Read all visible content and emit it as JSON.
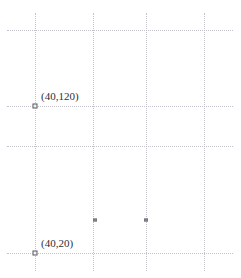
{
  "chart_data": {
    "type": "scatter",
    "title": "",
    "xlabel": "",
    "ylabel": "",
    "grid": true,
    "legend": null,
    "xlim": [
      0,
      260
    ],
    "ylim": [
      0,
      160
    ],
    "xticks": [
      40,
      100,
      160,
      220
    ],
    "yticks": [
      20,
      80,
      100,
      150
    ],
    "points": [
      {
        "label": "(40,120)",
        "x": 40,
        "y": 120,
        "has_label": true,
        "px": 35,
        "py": 106,
        "marker": "square"
      },
      {
        "label": "(40,20)",
        "x": 40,
        "y": 20,
        "has_label": true,
        "px": 35,
        "py": 253,
        "marker": "square"
      },
      {
        "label": "",
        "x": 100,
        "y": 35,
        "has_label": false,
        "px": 95,
        "py": 220,
        "marker": "square-small"
      },
      {
        "label": "",
        "x": 160,
        "y": 35,
        "has_label": false,
        "px": 146,
        "py": 220,
        "marker": "square-small"
      }
    ],
    "gridlines_vertical": [
      {
        "name": "gridline-x-40",
        "px": 35,
        "top": 13,
        "bottom": 271
      },
      {
        "name": "gridline-x-100",
        "px": 93,
        "top": 13,
        "bottom": 271
      },
      {
        "name": "gridline-x-160",
        "px": 146,
        "top": 13,
        "bottom": 271
      },
      {
        "name": "gridline-x-220",
        "px": 204,
        "top": 13,
        "bottom": 271
      }
    ],
    "gridlines_horizontal": [
      {
        "name": "gridline-y-150",
        "py": 30,
        "left": 7,
        "right": 233
      },
      {
        "name": "gridline-y-120",
        "py": 106,
        "left": 7,
        "right": 233
      },
      {
        "name": "gridline-y-80",
        "py": 146,
        "left": 7,
        "right": 233
      },
      {
        "name": "gridline-y-20",
        "py": 253,
        "left": 7,
        "right": 233
      }
    ],
    "colors": {
      "background": "#ffffff",
      "grid": "#b9b9c4",
      "marker_stroke": "#5a5a62",
      "marker_fill": "#f2f2f4",
      "label_text": "#2f2f36"
    }
  },
  "labels": {
    "point_1": "(40,120)",
    "point_2": "(40,20)"
  }
}
